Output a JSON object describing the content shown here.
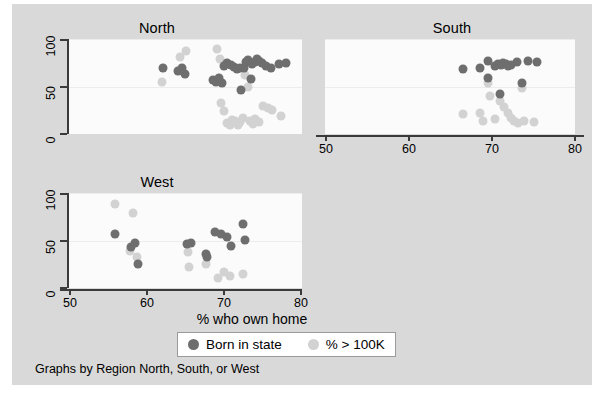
{
  "chart_data": {
    "type": "scatter",
    "title": "",
    "caption": "Graphs by Region North, South, or West",
    "xlabel": "% who own home",
    "ylabel": "",
    "xlim": [
      50,
      80
    ],
    "ylim": [
      0,
      100
    ],
    "xticks": [
      50,
      60,
      70,
      80
    ],
    "xticklabels": [
      "50",
      "60",
      "70",
      "80"
    ],
    "yticks": [
      0,
      50,
      100
    ],
    "yticklabels": [
      "0",
      "50",
      "100"
    ],
    "grid": true,
    "legend_position": "bottom-center",
    "colors": {
      "series_a": "#6e6e6e",
      "series_b": "#d2d2d2",
      "panel_background": "#fbfbfb",
      "figure_background": "#d9d9d9",
      "axis": "#3a3a3a"
    },
    "legend": [
      {
        "label": "Born in state",
        "color": "#6e6e6e"
      },
      {
        "label": "% > 100K",
        "color": "#d2d2d2"
      }
    ],
    "panels": [
      {
        "name": "North",
        "series": [
          {
            "name": "Born in state",
            "color": "#6e6e6e",
            "points": [
              [
                62.1,
                70
              ],
              [
                64.0,
                66
              ],
              [
                64.5,
                69
              ],
              [
                64.9,
                63
              ],
              [
                68.6,
                57
              ],
              [
                68.9,
                55
              ],
              [
                69.3,
                59
              ],
              [
                69.7,
                54
              ],
              [
                69.9,
                72
              ],
              [
                70.4,
                75
              ],
              [
                70.8,
                73
              ],
              [
                71.3,
                71
              ],
              [
                71.6,
                68
              ],
              [
                72.0,
                70
              ],
              [
                72.2,
                46
              ],
              [
                72.5,
                69
              ],
              [
                72.8,
                76
              ],
              [
                73.1,
                78
              ],
              [
                73.4,
                58
              ],
              [
                73.6,
                74
              ],
              [
                73.9,
                76
              ],
              [
                74.2,
                79
              ],
              [
                74.5,
                77
              ],
              [
                74.8,
                75
              ],
              [
                75.4,
                72
              ],
              [
                76.0,
                69
              ],
              [
                77.1,
                74
              ],
              [
                78.0,
                75
              ]
            ]
          },
          {
            "name": "% > 100K",
            "color": "#d2d2d2",
            "points": [
              [
                62.0,
                55
              ],
              [
                64.3,
                81
              ],
              [
                65.1,
                87
              ],
              [
                69.0,
                90
              ],
              [
                69.4,
                79
              ],
              [
                69.6,
                33
              ],
              [
                70.0,
                24
              ],
              [
                70.3,
                12
              ],
              [
                70.7,
                10
              ],
              [
                71.0,
                15
              ],
              [
                71.4,
                14
              ],
              [
                71.7,
                9
              ],
              [
                72.0,
                13
              ],
              [
                72.4,
                17
              ],
              [
                72.7,
                62
              ],
              [
                73.0,
                49
              ],
              [
                73.3,
                14
              ],
              [
                73.7,
                11
              ],
              [
                74.0,
                16
              ],
              [
                74.4,
                13
              ],
              [
                75.0,
                30
              ],
              [
                75.6,
                27
              ],
              [
                76.2,
                25
              ],
              [
                77.3,
                19
              ]
            ]
          }
        ]
      },
      {
        "name": "South",
        "series": [
          {
            "name": "Born in state",
            "color": "#6e6e6e",
            "points": [
              [
                66.6,
                68
              ],
              [
                68.6,
                70
              ],
              [
                69.5,
                77
              ],
              [
                70.4,
                72
              ],
              [
                70.8,
                74
              ],
              [
                71.1,
                73
              ],
              [
                71.4,
                75
              ],
              [
                71.7,
                74
              ],
              [
                72.0,
                72
              ],
              [
                72.3,
                73
              ],
              [
                73.0,
                76
              ],
              [
                73.6,
                54
              ],
              [
                74.4,
                77
              ],
              [
                75.4,
                76
              ],
              [
                69.6,
                59
              ],
              [
                71.0,
                42
              ]
            ]
          },
          {
            "name": "% > 100K",
            "color": "#d2d2d2",
            "points": [
              [
                66.5,
                21
              ],
              [
                68.6,
                22
              ],
              [
                68.9,
                14
              ],
              [
                69.6,
                54
              ],
              [
                69.8,
                40
              ],
              [
                70.4,
                16
              ],
              [
                71.0,
                35
              ],
              [
                71.5,
                28
              ],
              [
                71.9,
                22
              ],
              [
                72.3,
                17
              ],
              [
                72.7,
                14
              ],
              [
                73.1,
                12
              ],
              [
                73.6,
                48
              ],
              [
                73.9,
                14
              ],
              [
                75.1,
                13
              ]
            ]
          }
        ]
      },
      {
        "name": "West",
        "series": [
          {
            "name": "Born in state",
            "color": "#6e6e6e",
            "points": [
              [
                55.9,
                57
              ],
              [
                58.0,
                43
              ],
              [
                58.5,
                47
              ],
              [
                58.9,
                25
              ],
              [
                65.2,
                46
              ],
              [
                65.7,
                47
              ],
              [
                67.6,
                36
              ],
              [
                67.8,
                33
              ],
              [
                68.8,
                59
              ],
              [
                69.6,
                57
              ],
              [
                70.4,
                54
              ],
              [
                70.9,
                44
              ],
              [
                72.4,
                67
              ],
              [
                72.6,
                51
              ]
            ]
          },
          {
            "name": "% > 100K",
            "color": "#d2d2d2",
            "points": [
              [
                55.9,
                88
              ],
              [
                58.3,
                79
              ],
              [
                57.9,
                39
              ],
              [
                58.8,
                33
              ],
              [
                65.3,
                38
              ],
              [
                65.4,
                22
              ],
              [
                67.6,
                25
              ],
              [
                69.2,
                11
              ],
              [
                70.0,
                17
              ],
              [
                70.7,
                13
              ],
              [
                72.4,
                15
              ]
            ]
          }
        ]
      }
    ]
  },
  "panels": {
    "north": {
      "title": "North"
    },
    "south": {
      "title": "South"
    },
    "west": {
      "title": "West"
    }
  },
  "axes": {
    "x_title": "% who own home",
    "x_ticks": [
      "50",
      "60",
      "70",
      "80"
    ],
    "y_ticks": [
      "0",
      "50",
      "100"
    ]
  },
  "legend": {
    "item_a": "Born in state",
    "item_b": "% > 100K"
  },
  "footer": {
    "caption": "Graphs by Region North, South, or West"
  }
}
